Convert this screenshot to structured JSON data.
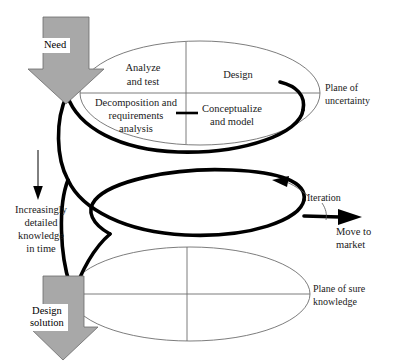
{
  "diagram": {
    "type": "spiral-design-process",
    "background_color": "#ffffff",
    "accent_gray": "#a8a8a8",
    "line_color": "#6e6e6e",
    "helix_color": "#000000"
  },
  "inputs": {
    "need_label": "Need",
    "output_label_line1": "Design",
    "output_label_line2": "solution"
  },
  "planes": [
    {
      "id": "uncertainty",
      "label_line1": "Plane of",
      "label_line2": "uncertainty",
      "quadrants": [
        {
          "position": "top-left",
          "line1": "Analyze",
          "line2": "and test",
          "line3": ""
        },
        {
          "position": "top-right",
          "line1": "Design",
          "line2": "",
          "line3": ""
        },
        {
          "position": "bottom-left",
          "line1": "Decomposition and",
          "line2": "requirements",
          "line3": "analysis"
        },
        {
          "position": "bottom-right",
          "line1": "Conceptualize",
          "line2": "and model",
          "line3": ""
        }
      ]
    },
    {
      "id": "sure-knowledge",
      "label_line1": "Plane of sure",
      "label_line2": "knowledge",
      "quadrants": []
    }
  ],
  "annotations": {
    "time_axis": {
      "line1": "Increasingly",
      "line2": "detailed",
      "line3": "knowledge",
      "line4": "in time",
      "direction": "down"
    },
    "iteration": {
      "label": "Iteration",
      "direction": "counter-clockwise"
    },
    "exit": {
      "line1": "Move to",
      "line2": "market",
      "direction": "right"
    }
  }
}
